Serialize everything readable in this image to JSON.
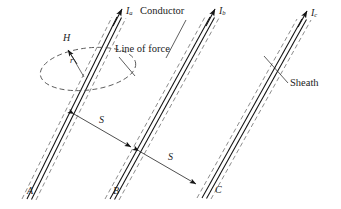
{
  "figure": {
    "type": "engineering-diagram"
  },
  "labels": {
    "current_a_symbol": "I",
    "current_a_sub": "a",
    "current_b_symbol": "I",
    "current_b_sub": "b",
    "current_c_symbol": "I",
    "current_c_sub": "c",
    "conductor": "Conductor",
    "line_of_force": "Line of force",
    "sheath": "Sheath",
    "field_strength": "H",
    "radius": "r",
    "spacing_ab": "S",
    "spacing_bc": "S",
    "cable_a": "A",
    "cable_b": "B",
    "cable_c": "C"
  },
  "colors": {
    "ink": "#1b1b1b",
    "conductor_line": "#111111",
    "sheath_line": "#6e6e6e",
    "leader_line": "#2a2a2a",
    "background": "#ffffff"
  },
  "geometry": {
    "cable_slope_note": "cables run lower-left to upper-right",
    "cable_a_bottom": [
      30,
      198
    ],
    "cable_a_top": [
      120,
      16
    ],
    "cable_b_bottom": [
      113,
      198
    ],
    "cable_b_top": [
      213,
      16
    ],
    "cable_c_bottom": [
      205,
      196
    ],
    "cable_c_top": [
      305,
      18
    ],
    "spacing_arrow_ab": [
      [
        69,
        111
      ],
      [
        133,
        148
      ]
    ],
    "spacing_arrow_bc": [
      [
        136,
        149
      ],
      [
        199,
        186
      ]
    ],
    "ellipse_center": [
      88,
      69
    ],
    "ellipse_rx": 48,
    "ellipse_ry": 21
  }
}
